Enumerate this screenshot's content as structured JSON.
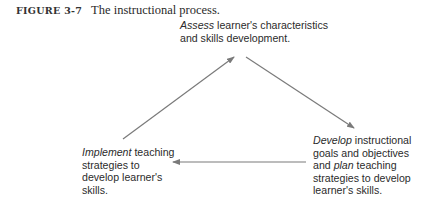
{
  "caption": {
    "label": "FIGURE 3-7",
    "title": "The instructional process."
  },
  "nodes": {
    "assess": {
      "verb": "Assess",
      "rest_line1": " learner's characteristics",
      "line2": "and skills development."
    },
    "develop": {
      "verb": "Develop",
      "rest_line1": " instructional",
      "line2": "goals and objectives",
      "line3_pre": "and ",
      "line3_verb": "plan",
      "line3_rest": " teaching",
      "line4": "strategies to develop",
      "line5": "learner's skills."
    },
    "implement": {
      "verb": "Implement",
      "rest_line1": " teaching",
      "line2": "strategies to",
      "line3": "develop learner's",
      "line4": "skills."
    }
  },
  "arrows": [
    {
      "from": "implement",
      "to": "assess"
    },
    {
      "from": "assess",
      "to": "develop"
    },
    {
      "from": "develop",
      "to": "implement"
    }
  ],
  "colors": {
    "text": "#2b2b2b",
    "arrow": "#7a7a7a"
  }
}
